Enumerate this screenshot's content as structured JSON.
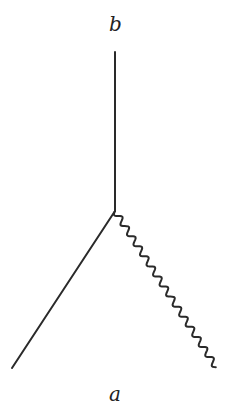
{
  "diagram": {
    "type": "feynman-vertex",
    "labels": {
      "top": "b",
      "bottom": "a"
    },
    "vertex": {
      "x": 115,
      "y": 211
    },
    "lines": [
      {
        "name": "vertical-line",
        "style": "straight",
        "from": [
          115,
          211
        ],
        "to": [
          115,
          52
        ]
      },
      {
        "name": "straight-diagonal-line",
        "style": "straight",
        "from": [
          115,
          211
        ],
        "to": [
          12,
          368
        ]
      },
      {
        "name": "wavy-line",
        "style": "wavy",
        "from": [
          115,
          211
        ],
        "to": [
          216,
          367
        ]
      }
    ],
    "colors": {
      "stroke": "#2a2a2a",
      "text": "#222222",
      "background": "#ffffff"
    }
  }
}
